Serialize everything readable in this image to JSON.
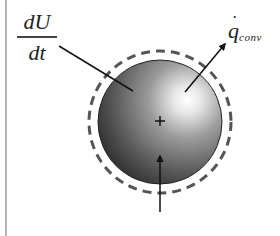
{
  "diagram": {
    "type": "energy-balance-sphere",
    "colors": {
      "background": "#ffffff",
      "line": "#1a1a1a",
      "dashed_boundary": "#555555",
      "frame_line": "#999999",
      "sphere_dark": "#1e1e1e",
      "sphere_highlight": "#ffffff"
    },
    "labels": {
      "internal_energy": {
        "numerator": "dU",
        "denominator": "dt"
      },
      "convection": {
        "symbol": "q",
        "subscript": "conv"
      },
      "input": {
        "symbol": "q",
        "subscript": "laser"
      }
    },
    "center_mark": "+"
  }
}
